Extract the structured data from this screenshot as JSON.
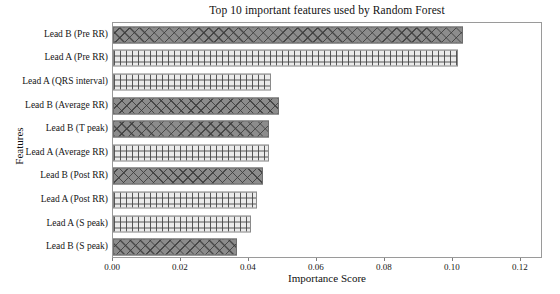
{
  "chart_data": {
    "type": "bar",
    "orientation": "horizontal",
    "title": "Top 10 important features used by Random Forest",
    "xlabel": "Importance Score",
    "ylabel": "Features",
    "categories": [
      "Lead B (Pre RR)",
      "Lead A (Pre RR)",
      "Lead A  (QRS interval)",
      "Lead B (Average RR)",
      "Lead B (T peak)",
      "Lead A (Average RR)",
      "Lead B (Post RR)",
      "Lead A (Post RR)",
      "Lead A (S peak)",
      "Lead B (S peak)"
    ],
    "values": [
      0.103,
      0.1014,
      0.0465,
      0.0488,
      0.0459,
      0.0459,
      0.0441,
      0.0424,
      0.0406,
      0.0365
    ],
    "series": [
      {
        "name": "Importance",
        "values": [
          0.103,
          0.1014,
          0.0465,
          0.0488,
          0.0459,
          0.0459,
          0.0441,
          0.0424,
          0.0406,
          0.0365
        ]
      }
    ],
    "bar_styles": [
      "dark",
      "light",
      "light",
      "dark",
      "dark",
      "light",
      "dark",
      "light",
      "light",
      "dark"
    ],
    "xlim": [
      0.0,
      0.1265
    ],
    "xticks": [
      0.0,
      0.02,
      0.04,
      0.06,
      0.08,
      0.1,
      0.12
    ],
    "xticklabels": [
      "0.00",
      "0.02",
      "0.04",
      "0.06",
      "0.08",
      "0.10",
      "0.12"
    ],
    "grid": false,
    "legend": null,
    "colors": {
      "dark_bar": "#8c8c8c",
      "light_bar": "#ebebeb",
      "edge": "#6d6d6d",
      "frame": "#9a9a9a",
      "text": "#151515",
      "background": "#ffffff"
    }
  }
}
